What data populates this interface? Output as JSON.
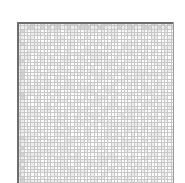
{
  "figure": {
    "title": "",
    "background_color": "#ffffff",
    "width_px": 185,
    "height_px": 183
  },
  "plot_area": {
    "name": "grid-plot",
    "left_px": 17,
    "top_px": 22,
    "width_px": 157,
    "height_px": 161,
    "clipped_at_bottom": true
  },
  "colors": {
    "page_background": "#ffffff",
    "cell_fill_light": "#ffffff",
    "cell_fill_mid": "#ededed",
    "cell_fill_dark": "#d2d2d2",
    "gridline": "#c8c8c8",
    "gridline_light": "#dcdcdc",
    "axis_rule": "#6e6e6e",
    "axis_rule_soft": "#9a9a9a"
  },
  "chart_data": {
    "type": "heatmap",
    "title": "",
    "subtitle": "",
    "xlabel": "",
    "ylabel": "",
    "xticklabels": [],
    "yticklabels": [],
    "legend": [],
    "legend_position": "none",
    "grid": true,
    "colormap": "greys",
    "value_range": [
      0,
      1
    ],
    "cell_pitch_px": 3.34,
    "cell_size_px": 2.1,
    "gridline_width_px": 1,
    "n_cols": 47,
    "n_rows": 48
  },
  "axes": {
    "top_rule_color": "#6e6e6e",
    "top_rule_width_px": 2,
    "left_rule_color": "#6e6e6e",
    "left_rule_width_px": 2,
    "right_rule_color": "#9a9a9a",
    "right_rule_width_px": 1
  }
}
